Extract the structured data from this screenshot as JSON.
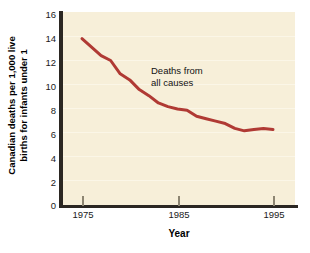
{
  "chart_data": {
    "type": "line",
    "title": "",
    "xlabel": "Year",
    "ylabel": "Canadian deaths per 1,000 live births for infants under 1",
    "ylabel_line1": "Canadian deaths per 1,000 live",
    "ylabel_line2": "births for infants under 1",
    "xlim": [
      1974,
      1996
    ],
    "ylim": [
      0,
      16
    ],
    "xticks": [
      1975,
      1985,
      1995
    ],
    "yticks": [
      0,
      2,
      4,
      6,
      8,
      10,
      12,
      14,
      16
    ],
    "grid": true,
    "legend": "none",
    "annotations": [
      {
        "text_line1": "Deaths from",
        "text_line2": "all causes",
        "x": 1983.2,
        "y": 10.6
      }
    ],
    "series": [
      {
        "name": "Deaths from all causes",
        "color": "#b03a34",
        "x": [
          1975,
          1976,
          1977,
          1978,
          1979,
          1980,
          1981,
          1982,
          1983,
          1984,
          1985,
          1986,
          1987,
          1988,
          1989,
          1990,
          1991,
          1992,
          1993,
          1994,
          1995
        ],
        "values": [
          13.8,
          13.1,
          12.4,
          12.0,
          10.9,
          10.4,
          9.6,
          9.1,
          8.5,
          8.2,
          8.0,
          7.9,
          7.4,
          7.2,
          7.0,
          6.8,
          6.4,
          6.2,
          6.3,
          6.4,
          6.3
        ]
      }
    ]
  },
  "colors": {
    "line": "#b03a34",
    "plot_background": "#f7efd9",
    "axis": "#2b2722",
    "gridline": "#fbf6e7",
    "page_background": "#ffffff"
  }
}
